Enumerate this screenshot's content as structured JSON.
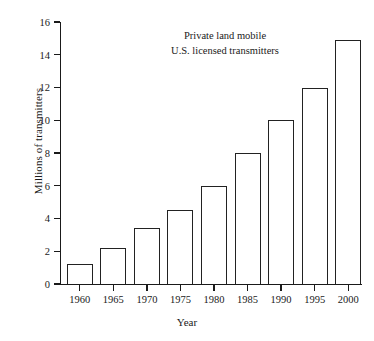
{
  "chart_data": {
    "type": "bar",
    "title": "Private land mobile\nU.S. licensed transmitters",
    "title_line1": "Private land mobile",
    "title_line2": "U.S. licensed transmitters",
    "xlabel": "Year",
    "ylabel": "Millions of transmitters",
    "categories": [
      "1960",
      "1965",
      "1970",
      "1975",
      "1980",
      "1985",
      "1990",
      "1995",
      "2000"
    ],
    "values": [
      1.2,
      2.2,
      3.4,
      4.5,
      6.0,
      8.0,
      10.0,
      12.0,
      14.9
    ],
    "ylim": [
      0,
      16
    ],
    "yticks": [
      0,
      2,
      4,
      6,
      8,
      10,
      12,
      14,
      16
    ],
    "ytick_labels": [
      "0",
      "2",
      "4",
      "6",
      "8",
      "10",
      "12",
      "14",
      "16"
    ],
    "grid": false,
    "legend": null,
    "bar_fill_color": "#ffffff",
    "bar_edge_color": "#222222",
    "axis_color": "#1a1a1a",
    "background_color": "#ffffff"
  }
}
